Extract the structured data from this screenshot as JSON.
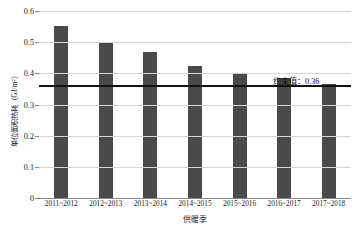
{
  "chart_data": {
    "type": "bar",
    "title": "",
    "xlabel": "供暖季",
    "ylabel": "单位面积热耗（GJ/m²）",
    "categories": [
      "2011~2012",
      "2012~2013",
      "2013~2014",
      "2014~2015",
      "2015~2016",
      "2016~2017",
      "2017~2018"
    ],
    "values": [
      0.551,
      0.497,
      0.468,
      0.423,
      0.4,
      0.385,
      0.365
    ],
    "ylim": [
      0,
      0.6
    ],
    "yticks": [
      "0",
      "0.1",
      "0.2",
      "0.3",
      "0.4",
      "0.5",
      "0.6"
    ],
    "ytick_values": [
      0,
      0.1,
      0.2,
      0.3,
      0.4,
      0.5,
      0.6
    ],
    "grid": true,
    "legend": "none",
    "bar_color": "#4a4a4a",
    "gridline_color": "#d4d4d4",
    "annotations": [
      {
        "name": "constraint-line",
        "label": "约束值：0.36",
        "value": 0.36,
        "color": "#111111",
        "type": "hline"
      }
    ]
  }
}
